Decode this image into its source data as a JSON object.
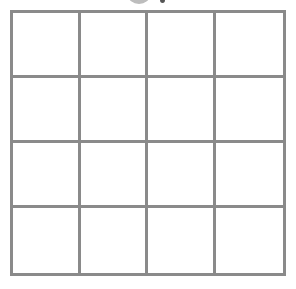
{
  "grid": {
    "rows": 4,
    "columns": 4,
    "line_color": "#8a8a8a",
    "cells": [
      [
        "",
        "",
        "",
        ""
      ],
      [
        "",
        "",
        "",
        ""
      ],
      [
        "",
        "",
        "",
        ""
      ],
      [
        "",
        "",
        "",
        ""
      ]
    ]
  },
  "top_graphic": {
    "icon": "partially-clipped-gray-circle",
    "color": "#bdbdbd"
  }
}
